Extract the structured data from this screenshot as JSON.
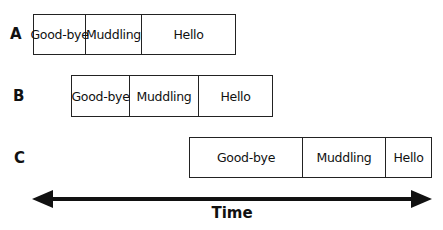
{
  "rows": [
    {
      "label": "A",
      "segments": [
        {
          "text": "Good-bye",
          "width": 52
        },
        {
          "text": "Muddling",
          "width": 56
        },
        {
          "text": "Hello",
          "width": 95
        }
      ]
    },
    {
      "label": "B",
      "segments": [
        {
          "text": "Good-bye",
          "width": 58
        },
        {
          "text": "Muddling",
          "width": 69
        },
        {
          "text": "Hello",
          "width": 75
        }
      ]
    },
    {
      "label": "C",
      "segments": [
        {
          "text": "Good-bye",
          "width": 113
        },
        {
          "text": "Muddling",
          "width": 83
        },
        {
          "text": "Hello",
          "width": 47
        }
      ]
    }
  ],
  "axis": {
    "label": "Time",
    "direction": "bidirectional"
  }
}
